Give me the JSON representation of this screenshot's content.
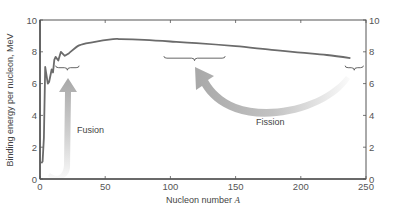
{
  "chart_data": {
    "type": "line",
    "title": "",
    "xlabel": "Nucleon number",
    "xlabel_italic_var": "A",
    "ylabel": "Binding energy per nucleon, MeV",
    "xlim": [
      0,
      250
    ],
    "ylim": [
      0,
      10
    ],
    "x_ticks": [
      0,
      50,
      100,
      150,
      200,
      250
    ],
    "y_ticks": [
      0,
      2,
      4,
      6,
      8,
      10
    ],
    "right_y_ticks": [
      0,
      2,
      4,
      6,
      8,
      10
    ],
    "grid": false,
    "legend": null,
    "series": [
      {
        "name": "Binding energy per nucleon",
        "color": "#6b6b6b",
        "x": [
          1,
          2,
          3,
          4,
          6,
          7,
          9,
          10,
          11,
          12,
          14,
          16,
          19,
          22,
          30,
          40,
          56,
          62,
          80,
          100,
          120,
          150,
          180,
          200,
          220,
          238
        ],
        "y": [
          1.0,
          1.1,
          2.6,
          7.05,
          6.0,
          6.1,
          6.9,
          6.7,
          7.5,
          7.68,
          7.45,
          8.0,
          7.75,
          7.9,
          8.4,
          8.6,
          8.8,
          8.8,
          8.75,
          8.65,
          8.55,
          8.35,
          8.1,
          7.95,
          7.8,
          7.6
        ]
      }
    ],
    "annotations": [
      {
        "type": "brace",
        "label": "",
        "x_range": [
          12,
          30
        ],
        "y": 7.0
      },
      {
        "type": "brace",
        "label": "",
        "x_range": [
          95,
          142
        ],
        "y": 7.6
      },
      {
        "type": "brace",
        "label": "",
        "x_range": [
          234,
          248
        ],
        "y": 7.0
      },
      {
        "type": "arrow",
        "label": "Fusion",
        "from": [
          12,
          0.3
        ],
        "to": [
          24,
          6.5
        ],
        "color": "#a8a8a8"
      },
      {
        "type": "arrow",
        "label": "Fission",
        "from": [
          240,
          6.6
        ],
        "to": [
          118,
          7.0
        ],
        "color": "#a8a8a8"
      }
    ]
  },
  "labels": {
    "xlabel": "Nucleon number ",
    "xlabel_var": "A",
    "ylabel": "Binding energy per nucleon, MeV",
    "fusion": "Fusion",
    "fission": "Fission"
  },
  "colors": {
    "axis": "#555555",
    "curve": "#6b6b6b",
    "arrow": "#a8a8a8",
    "brace": "#555555"
  }
}
